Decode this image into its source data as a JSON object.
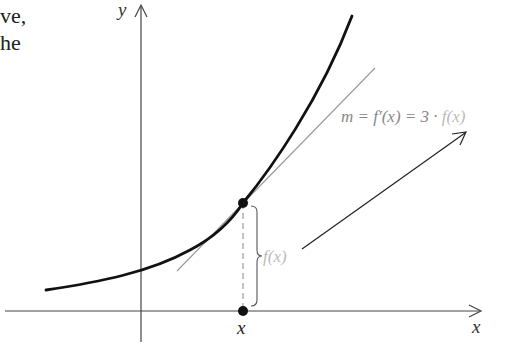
{
  "text_fragment": {
    "lines": [
      "ve,",
      "he"
    ]
  },
  "axes": {
    "y_label": "y",
    "x_label": "x",
    "x_marker_label": "x"
  },
  "annotations": {
    "slope_prefix": "m = f′(x) = 3 · ",
    "slope_suffix": "f(x)",
    "brace_label": "f(x)"
  },
  "colors": {
    "curve": "#111111",
    "axes": "#444444",
    "tangent": "#999999",
    "label_dark": "#888888",
    "label_light": "#bbbbbb"
  }
}
